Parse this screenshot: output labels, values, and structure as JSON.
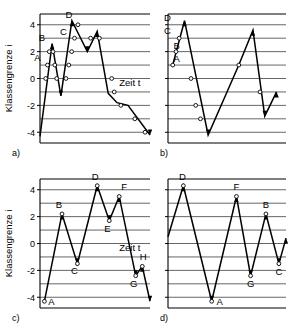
{
  "figure": {
    "axis": {
      "ylabel": "Klassengrenze i",
      "xlabel": "Zeit t",
      "yticks": [
        "4",
        "2",
        "0",
        "-2",
        "-4"
      ],
      "ytick_values": [
        4,
        2,
        0,
        -2,
        -4
      ],
      "gridlines": [
        4,
        3,
        2,
        1,
        0,
        -1,
        -2,
        -3,
        -4
      ],
      "ylim": [
        -4.8,
        4.8
      ],
      "grid": true,
      "grid_color": "#555555",
      "line_color": "#000000",
      "marker_fill": "#ffffff"
    },
    "panels": [
      {
        "id": "a",
        "caption": "a)",
        "show_ylabel": true,
        "show_xlabel": true,
        "xlabel_pos": {
          "x": 0.72,
          "y": -0.55
        },
        "chart_data": {
          "type": "line",
          "title": "",
          "xlabel": "Zeit t",
          "ylabel": "Klassengrenze i",
          "ylim": [
            -4.8,
            4.8
          ],
          "grid": true,
          "x": [
            0.0,
            0.11,
            0.19,
            0.29,
            0.43,
            0.52,
            0.62,
            0.7,
            0.8,
            1.0
          ],
          "y": [
            -4.3,
            2.6,
            -1.3,
            4.3,
            2.0,
            3.5,
            -1.1,
            -1.8,
            -2.0,
            -4.2
          ],
          "markers": [
            {
              "x": 0.052,
              "y": 0.0,
              "label": ""
            },
            {
              "x": 0.068,
              "y": 1.0,
              "label": "A"
            },
            {
              "x": 0.084,
              "y": 2.0,
              "label": ""
            },
            {
              "x": 0.118,
              "y": 2.0,
              "label": ""
            },
            {
              "x": 0.135,
              "y": 1.0,
              "label": ""
            },
            {
              "x": 0.152,
              "y": 0.0,
              "label": ""
            },
            {
              "x": 0.236,
              "y": 0.0,
              "label": ""
            },
            {
              "x": 0.262,
              "y": 1.0,
              "label": ""
            },
            {
              "x": 0.288,
              "y": 2.0,
              "label": ""
            },
            {
              "x": 0.314,
              "y": 3.0,
              "label": "C"
            },
            {
              "x": 0.345,
              "y": 4.0,
              "label": ""
            },
            {
              "x": 0.46,
              "y": 3.0,
              "label": ""
            },
            {
              "x": 0.54,
              "y": 3.0,
              "label": ""
            },
            {
              "x": 0.652,
              "y": 0.0,
              "label": ""
            },
            {
              "x": 0.675,
              "y": -1.0,
              "label": ""
            },
            {
              "x": 0.735,
              "y": -2.0,
              "label": ""
            },
            {
              "x": 0.862,
              "y": -3.0,
              "label": ""
            },
            {
              "x": 0.955,
              "y": -4.0,
              "label": ""
            }
          ],
          "peak_labels": [
            {
              "x": 0.068,
              "y": 1.0,
              "text": "A",
              "dx": -10,
              "dy": -4
            },
            {
              "x": 0.108,
              "y": 2.6,
              "text": "B",
              "dx": -10,
              "dy": -3
            },
            {
              "x": 0.314,
              "y": 3.0,
              "text": "C",
              "dx": -11,
              "dy": -3
            },
            {
              "x": 0.29,
              "y": 4.3,
              "text": "D",
              "dx": -3,
              "dy": -3
            }
          ]
        }
      },
      {
        "id": "b",
        "caption": "b)",
        "show_ylabel": false,
        "show_xlabel": false,
        "chart_data": {
          "type": "line",
          "title": "",
          "xlabel": "",
          "ylabel": "",
          "ylim": [
            -4.8,
            4.8
          ],
          "grid": true,
          "x": [
            0.04,
            0.14,
            0.34,
            0.5,
            0.6,
            0.72,
            0.82,
            0.92
          ],
          "y": [
            1.0,
            4.3,
            -4.2,
            -1.0,
            1.0,
            3.6,
            -2.8,
            -1.0
          ],
          "markers": [
            {
              "x": 0.04,
              "y": 1.0,
              "label": ""
            },
            {
              "x": 0.068,
              "y": 2.0,
              "label": "B"
            },
            {
              "x": 0.095,
              "y": 3.0,
              "label": ""
            },
            {
              "x": 0.195,
              "y": 0.0,
              "label": ""
            },
            {
              "x": 0.235,
              "y": -2.0,
              "label": ""
            },
            {
              "x": 0.275,
              "y": -3.0,
              "label": ""
            },
            {
              "x": 0.6,
              "y": 1.0,
              "label": ""
            },
            {
              "x": 0.78,
              "y": -1.0,
              "label": ""
            }
          ],
          "peak_labels": [
            {
              "x": 0.04,
              "y": 1.2,
              "text": "A",
              "dx": 4,
              "dy": 0
            },
            {
              "x": 0.04,
              "y": 2.2,
              "text": "B",
              "dx": 4,
              "dy": 0
            },
            {
              "x": 0.02,
              "y": 3.3,
              "text": "C",
              "dx": -3,
              "dy": 0
            },
            {
              "x": 0.02,
              "y": 4.3,
              "text": "D",
              "dx": -3,
              "dy": 0
            }
          ]
        }
      },
      {
        "id": "c",
        "caption": "c)",
        "show_ylabel": true,
        "show_xlabel": true,
        "xlabel_pos": {
          "x": 0.72,
          "y": -0.55
        },
        "chart_data": {
          "type": "line",
          "title": "",
          "xlabel": "Zeit t",
          "ylabel": "Klassengrenze i",
          "ylim": [
            -4.8,
            4.8
          ],
          "grid": true,
          "x": [
            0.04,
            0.2,
            0.34,
            0.52,
            0.63,
            0.72,
            0.87,
            0.93,
            1.0
          ],
          "y": [
            -4.3,
            2.2,
            -1.5,
            4.3,
            1.7,
            3.5,
            -2.4,
            -1.7,
            -4.3
          ],
          "markers": [
            {
              "x": 0.04,
              "y": -4.3,
              "label": "A"
            },
            {
              "x": 0.2,
              "y": 2.2,
              "label": "B"
            },
            {
              "x": 0.34,
              "y": -1.5,
              "label": "C"
            },
            {
              "x": 0.52,
              "y": 4.3,
              "label": "D"
            },
            {
              "x": 0.63,
              "y": 1.7,
              "label": "E"
            },
            {
              "x": 0.72,
              "y": 3.5,
              "label": "F"
            },
            {
              "x": 0.87,
              "y": -2.4,
              "label": "G"
            },
            {
              "x": 0.93,
              "y": -1.7,
              "label": "H"
            }
          ],
          "peak_labels": [
            {
              "x": 0.04,
              "y": -4.3,
              "text": "A",
              "dx": 7,
              "dy": 4
            },
            {
              "x": 0.2,
              "y": 2.2,
              "text": "B",
              "dx": -3,
              "dy": -6
            },
            {
              "x": 0.34,
              "y": -1.5,
              "text": "C",
              "dx": -3,
              "dy": 10
            },
            {
              "x": 0.52,
              "y": 4.3,
              "text": "D",
              "dx": -2,
              "dy": -6
            },
            {
              "x": 0.63,
              "y": 1.7,
              "text": "E",
              "dx": -2,
              "dy": 11
            },
            {
              "x": 0.72,
              "y": 3.5,
              "text": "F",
              "dx": 5,
              "dy": -6
            },
            {
              "x": 0.87,
              "y": -2.4,
              "text": "G",
              "dx": -2,
              "dy": 11
            },
            {
              "x": 0.93,
              "y": -1.7,
              "text": "H",
              "dx": 1,
              "dy": -6
            }
          ]
        }
      },
      {
        "id": "d",
        "caption": "d)",
        "show_ylabel": false,
        "show_xlabel": false,
        "chart_data": {
          "type": "line",
          "title": "",
          "xlabel": "",
          "ylabel": "",
          "ylim": [
            -4.8,
            4.8
          ],
          "grid": true,
          "x": [
            0.0,
            0.13,
            0.37,
            0.58,
            0.7,
            0.83,
            0.94,
            1.0
          ],
          "y": [
            0.5,
            4.3,
            -4.3,
            3.5,
            -2.4,
            2.2,
            -1.5,
            0.4
          ],
          "markers": [
            {
              "x": 0.13,
              "y": 4.3,
              "label": "D"
            },
            {
              "x": 0.37,
              "y": -4.3,
              "label": "A"
            },
            {
              "x": 0.58,
              "y": 3.5,
              "label": "F"
            },
            {
              "x": 0.7,
              "y": -2.4,
              "label": "G"
            },
            {
              "x": 0.83,
              "y": 2.2,
              "label": "B"
            },
            {
              "x": 0.94,
              "y": -1.5,
              "label": "C"
            }
          ],
          "peak_labels": [
            {
              "x": 0.13,
              "y": 4.3,
              "text": "D",
              "dx": -1,
              "dy": -6
            },
            {
              "x": 0.37,
              "y": -4.3,
              "text": "A",
              "dx": 8,
              "dy": 4
            },
            {
              "x": 0.58,
              "y": 3.5,
              "text": "F",
              "dx": 0,
              "dy": -6
            },
            {
              "x": 0.7,
              "y": -2.4,
              "text": "G",
              "dx": 0,
              "dy": 11
            },
            {
              "x": 0.83,
              "y": 2.2,
              "text": "B",
              "dx": 0,
              "dy": -6
            },
            {
              "x": 0.94,
              "y": -1.5,
              "text": "C",
              "dx": 0,
              "dy": 11
            }
          ]
        }
      }
    ]
  }
}
